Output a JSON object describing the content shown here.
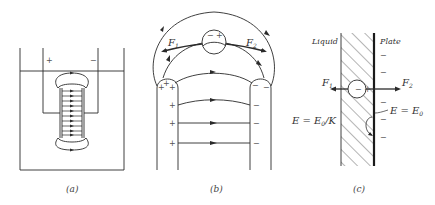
{
  "figure": {
    "panels": [
      {
        "id": "a",
        "caption": "(a)",
        "description": "Electrodes immersed in liquid container with field lines between them",
        "labels": {
          "plus": "+",
          "minus": "−"
        },
        "field_line_count": 10
      },
      {
        "id": "b",
        "caption": "(b)",
        "description": "Two electrodes with curved field lines and a dipole particle experiencing forces",
        "labels": {
          "force_left": "F",
          "force_left_sub": "1",
          "force_right": "F",
          "force_right_sub": "2",
          "dipole_minus": "−",
          "dipole_plus": "+",
          "left_electrode_charge": "+",
          "right_electrode_charge": "−"
        }
      },
      {
        "id": "c",
        "caption": "(c)",
        "description": "Particle near plate in liquid dielectric layer",
        "labels": {
          "liquid": "Liquid",
          "plate": "Plate",
          "force_left": "F",
          "force_left_sub": "1",
          "force_right": "F",
          "force_right_sub": "2",
          "field_inside": "E = E",
          "field_inside_sub": "0",
          "field_inside_suffix": "/K",
          "field_outside": "E = E",
          "field_outside_sub": "0",
          "plate_charge": "−"
        }
      }
    ],
    "colors": {
      "line": "#2a2a2a",
      "text": "#333333",
      "background": "#ffffff"
    }
  }
}
